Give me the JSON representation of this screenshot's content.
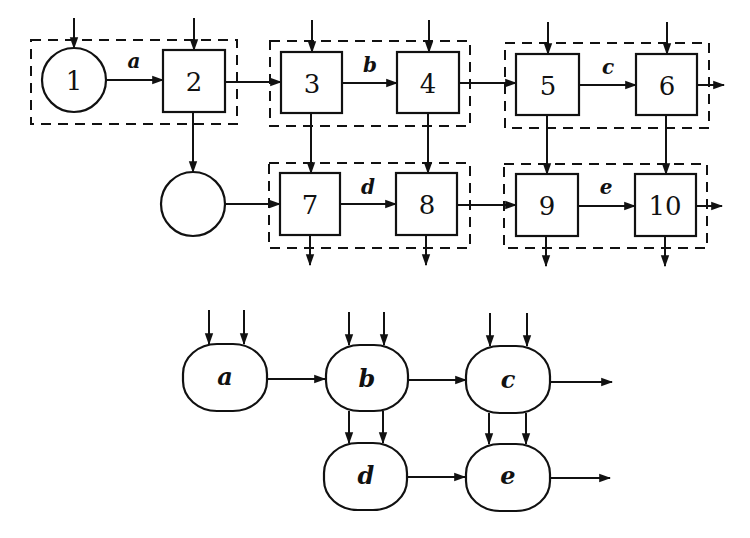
{
  "upper_diagram": {
    "nodes": [
      {
        "id": "1",
        "shape": "circle",
        "label": "1"
      },
      {
        "id": "2",
        "shape": "box",
        "label": "2"
      },
      {
        "id": "3",
        "shape": "box",
        "label": "3"
      },
      {
        "id": "4",
        "shape": "box",
        "label": "4"
      },
      {
        "id": "5",
        "shape": "box",
        "label": "5"
      },
      {
        "id": "6",
        "shape": "box",
        "label": "6"
      },
      {
        "id": "blank",
        "shape": "circle",
        "label": ""
      },
      {
        "id": "7",
        "shape": "box",
        "label": "7"
      },
      {
        "id": "8",
        "shape": "box",
        "label": "8"
      },
      {
        "id": "9",
        "shape": "box",
        "label": "9"
      },
      {
        "id": "10",
        "shape": "box",
        "label": "10"
      }
    ],
    "groups": [
      {
        "name": "a",
        "members": [
          "1",
          "2"
        ]
      },
      {
        "name": "b",
        "members": [
          "3",
          "4"
        ]
      },
      {
        "name": "c",
        "members": [
          "5",
          "6"
        ]
      },
      {
        "name": "d",
        "members": [
          "7",
          "8"
        ]
      },
      {
        "name": "e",
        "members": [
          "9",
          "10"
        ]
      }
    ],
    "edge_labels": {
      "a": "a",
      "b": "b",
      "c": "c",
      "d": "d",
      "e": "e"
    },
    "edges": [
      [
        "1",
        "2"
      ],
      [
        "2",
        "3"
      ],
      [
        "3",
        "4"
      ],
      [
        "4",
        "5"
      ],
      [
        "5",
        "6"
      ],
      [
        "2",
        "blank"
      ],
      [
        "blank",
        "7"
      ],
      [
        "7",
        "8"
      ],
      [
        "8",
        "9"
      ],
      [
        "9",
        "10"
      ],
      [
        "3",
        "7"
      ],
      [
        "4",
        "8"
      ],
      [
        "5",
        "9"
      ],
      [
        "6",
        "10"
      ]
    ]
  },
  "lower_diagram": {
    "nodes": [
      {
        "id": "a",
        "label": "a"
      },
      {
        "id": "b",
        "label": "b"
      },
      {
        "id": "c",
        "label": "c"
      },
      {
        "id": "d",
        "label": "d"
      },
      {
        "id": "e",
        "label": "e"
      }
    ],
    "edges": [
      [
        "a",
        "b"
      ],
      [
        "b",
        "c"
      ],
      [
        "b",
        "d"
      ],
      [
        "c",
        "e"
      ],
      [
        "d",
        "e"
      ]
    ]
  }
}
